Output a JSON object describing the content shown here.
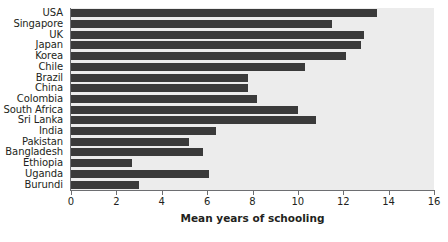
{
  "chart_data": {
    "type": "bar",
    "orientation": "horizontal",
    "title": "",
    "xlabel": "Mean years of schooling",
    "ylabel": "",
    "xlim": [
      0,
      16
    ],
    "xticks": [
      0,
      2,
      4,
      6,
      8,
      10,
      12,
      14,
      16
    ],
    "xtick_labels": [
      "0",
      "2",
      "4",
      "6",
      "8",
      "10",
      "12",
      "14",
      "16"
    ],
    "grid": false,
    "legend": null,
    "categories": [
      "USA",
      "Singapore",
      "UK",
      "Japan",
      "Korea",
      "Chile",
      "Brazil",
      "China",
      "Colombia",
      "South Africa",
      "Sri Lanka",
      "India",
      "Pakistan",
      "Bangladesh",
      "Ethiopia",
      "Uganda",
      "Burundi"
    ],
    "values": [
      13.5,
      11.5,
      12.9,
      12.8,
      12.1,
      10.3,
      7.8,
      7.8,
      8.2,
      10.0,
      10.8,
      6.4,
      5.2,
      5.8,
      2.7,
      6.1,
      3.0
    ],
    "bar_color": "#3a3a3a",
    "plot_background": "#ececec",
    "axis_color": "#6d6e71",
    "text_color": "#231f20"
  }
}
